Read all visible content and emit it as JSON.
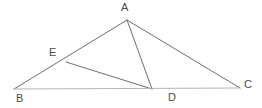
{
  "figure": {
    "kind": "geometry-diagram",
    "background_color": "#ffffff",
    "line_color": "#6e6e6e",
    "base_line_color": "#b4b4b4",
    "label_color": "#4a4a4a",
    "line_width": 1,
    "points": [
      {
        "id": "A",
        "label": "A",
        "x": 127,
        "y": 20,
        "label_x": 121,
        "label_y": 2
      },
      {
        "id": "B",
        "label": "B",
        "x": 14,
        "y": 89,
        "label_x": 16,
        "label_y": 93
      },
      {
        "id": "C",
        "label": "C",
        "x": 240,
        "y": 88,
        "label_x": 244,
        "label_y": 79
      },
      {
        "id": "D",
        "label": "D",
        "x": 152,
        "y": 89,
        "label_x": 168,
        "label_y": 92
      },
      {
        "id": "E",
        "label": "E",
        "x": 66,
        "y": 62,
        "label_x": 49,
        "label_y": 47
      }
    ],
    "segments": [
      {
        "id": "AB",
        "from": "A",
        "to": "B",
        "style": "dark"
      },
      {
        "id": "AC",
        "from": "A",
        "to": "C",
        "style": "dark"
      },
      {
        "id": "AD",
        "from": "A",
        "to": "D",
        "style": "dark"
      },
      {
        "id": "ED",
        "from": "E",
        "to": "D",
        "style": "dark"
      },
      {
        "id": "BC",
        "from": "B",
        "to": "C",
        "style": "light"
      }
    ]
  }
}
